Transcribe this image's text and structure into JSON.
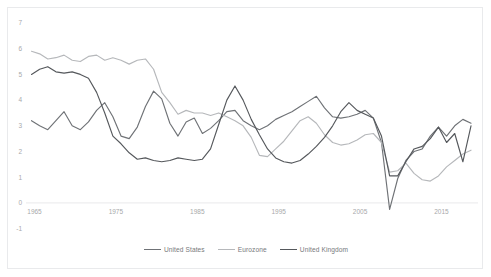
{
  "chart_data": {
    "type": "line",
    "title": "",
    "subtitle": "",
    "xlabel": "",
    "ylabel": "",
    "xlim": [
      1965,
      2019
    ],
    "ylim": [
      -1,
      7
    ],
    "y_ticks": [
      7,
      6,
      5,
      4,
      3,
      2,
      1,
      0,
      -1
    ],
    "x_ticks": [
      1965,
      1975,
      1985,
      1995,
      2005,
      2015
    ],
    "grid": false,
    "legend_position": "bottom-center",
    "x": [
      1965,
      1966,
      1967,
      1968,
      1969,
      1970,
      1971,
      1972,
      1973,
      1974,
      1975,
      1976,
      1977,
      1978,
      1979,
      1980,
      1981,
      1982,
      1983,
      1984,
      1985,
      1986,
      1987,
      1988,
      1989,
      1990,
      1991,
      1992,
      1993,
      1994,
      1995,
      1996,
      1997,
      1998,
      1999,
      2000,
      2001,
      2002,
      2003,
      2004,
      2005,
      2006,
      2007,
      2008,
      2009,
      2010,
      2011,
      2012,
      2013,
      2014,
      2015,
      2016,
      2017,
      2018,
      2019
    ],
    "series": [
      {
        "name": "United States",
        "color": "#6f7276",
        "values": [
          3.2,
          3.0,
          2.85,
          3.2,
          3.55,
          3.0,
          2.85,
          3.15,
          3.6,
          3.9,
          3.35,
          2.6,
          2.5,
          2.95,
          3.75,
          4.35,
          4.05,
          3.1,
          2.6,
          3.15,
          3.3,
          2.7,
          2.9,
          3.2,
          3.55,
          3.6,
          3.2,
          3.0,
          2.85,
          3.0,
          3.25,
          3.4,
          3.55,
          3.75,
          3.95,
          4.15,
          3.7,
          3.35,
          3.3,
          3.35,
          3.45,
          3.6,
          3.3,
          2.35,
          -0.25,
          0.95,
          1.65,
          2.0,
          2.1,
          2.6,
          2.95,
          2.6,
          3.0,
          3.25,
          3.1
        ]
      },
      {
        "name": "Eurozone",
        "color": "#b6b8bb",
        "values": [
          5.9,
          5.8,
          5.6,
          5.65,
          5.75,
          5.55,
          5.5,
          5.7,
          5.75,
          5.55,
          5.65,
          5.55,
          5.4,
          5.55,
          5.6,
          5.2,
          4.3,
          3.9,
          3.45,
          3.6,
          3.5,
          3.5,
          3.4,
          3.5,
          3.35,
          3.2,
          3.0,
          2.55,
          1.85,
          1.8,
          2.1,
          2.4,
          2.8,
          3.2,
          3.35,
          3.1,
          2.65,
          2.35,
          2.25,
          2.3,
          2.45,
          2.65,
          2.7,
          2.35,
          1.2,
          1.25,
          1.55,
          1.15,
          0.9,
          0.85,
          1.05,
          1.4,
          1.65,
          1.9,
          2.05
        ]
      },
      {
        "name": "United Kingdom",
        "color": "#55585c",
        "values": [
          5.0,
          5.2,
          5.3,
          5.1,
          5.05,
          5.1,
          5.0,
          4.85,
          4.3,
          3.5,
          2.6,
          2.3,
          1.95,
          1.7,
          1.75,
          1.65,
          1.6,
          1.65,
          1.75,
          1.7,
          1.65,
          1.7,
          2.1,
          3.05,
          4.0,
          4.55,
          4.0,
          3.25,
          2.65,
          2.1,
          1.75,
          1.6,
          1.55,
          1.65,
          1.9,
          2.2,
          2.55,
          3.0,
          3.55,
          3.9,
          3.6,
          3.45,
          3.3,
          2.6,
          1.05,
          1.05,
          1.6,
          2.1,
          2.2,
          2.5,
          2.95,
          2.35,
          2.7,
          1.6,
          3.0
        ]
      }
    ]
  },
  "axis": {
    "y_tick_labels": [
      "7",
      "6",
      "5",
      "4",
      "3",
      "2",
      "1",
      "0",
      "-1"
    ],
    "x_tick_labels": [
      "1965",
      "1975",
      "1985",
      "1995",
      "2005",
      "2015"
    ]
  },
  "legend": {
    "items": [
      {
        "label": "United States",
        "color": "#6f7276"
      },
      {
        "label": "Eurozone",
        "color": "#b6b8bb"
      },
      {
        "label": "United Kingdom",
        "color": "#55585c"
      }
    ]
  }
}
